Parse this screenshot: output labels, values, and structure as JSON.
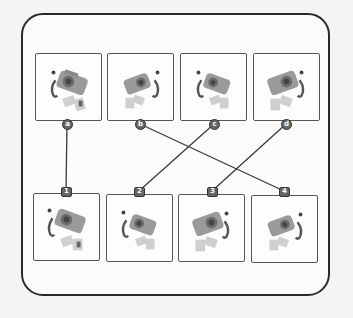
{
  "diagram": {
    "type": "matching-exercise",
    "top_row": [
      {
        "label": "a",
        "icon": "camera-icon",
        "facing": "right"
      },
      {
        "label": "b",
        "icon": "camera-icon",
        "facing": "left"
      },
      {
        "label": "c",
        "icon": "camera-icon",
        "facing": "right"
      },
      {
        "label": "d",
        "icon": "camera-icon",
        "facing": "left"
      }
    ],
    "bottom_row": [
      {
        "label": "1",
        "icon": "camera-icon",
        "facing": "right"
      },
      {
        "label": "2",
        "icon": "camera-icon",
        "facing": "right"
      },
      {
        "label": "3",
        "icon": "camera-icon",
        "facing": "left"
      },
      {
        "label": "4",
        "icon": "camera-icon",
        "facing": "left"
      }
    ],
    "connections": [
      {
        "from": "a",
        "to": "1"
      },
      {
        "from": "b",
        "to": "4"
      },
      {
        "from": "c",
        "to": "2"
      },
      {
        "from": "d",
        "to": "3"
      }
    ],
    "colors": {
      "frame": "#2a2a2a",
      "card_border": "#555555",
      "line": "#3a3a3a",
      "badge": "#666666"
    }
  }
}
